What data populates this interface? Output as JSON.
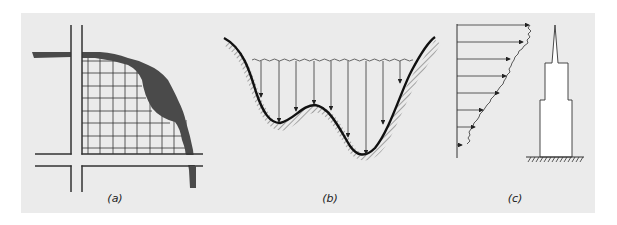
{
  "figure": {
    "background_color": "#ebebeb",
    "ink_color": "#222222",
    "river_color": "#4a4a4a",
    "panels": [
      {
        "id": "a",
        "label": "(a)",
        "description": "Grid of parcels bounded by roads and a river",
        "label_x": 115
      },
      {
        "id": "b",
        "label": "(b)",
        "description": "Valley profile with water surface and vertical arrows to terrain",
        "label_x": 330
      },
      {
        "id": "c",
        "label": "(c)",
        "description": "Wind velocity profile beside a tall stepped building",
        "label_x": 515
      }
    ]
  }
}
